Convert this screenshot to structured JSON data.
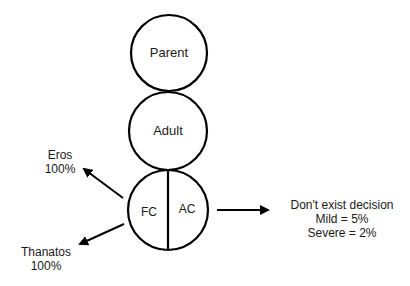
{
  "diagram": {
    "ego_states": [
      {
        "label": "Parent"
      },
      {
        "label": "Adult"
      },
      {
        "label": "Child",
        "parts": [
          {
            "label": "FC"
          },
          {
            "label": "AC"
          }
        ]
      }
    ],
    "outputs": {
      "eros": {
        "name": "Eros",
        "value": "100%"
      },
      "thanatos": {
        "name": "Thanatos",
        "value": "100%"
      },
      "decision": {
        "title": "Don't exist decision",
        "mild": "Mild = 5%",
        "severe": "Severe = 2%"
      }
    },
    "colors": {
      "stroke": "#000000",
      "text": "#1a1a1a",
      "background": "#ffffff"
    }
  }
}
